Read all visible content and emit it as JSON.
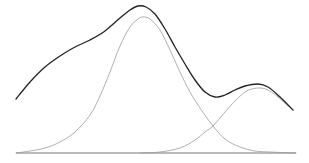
{
  "chart_data": {
    "type": "line",
    "title": "",
    "xlabel": "",
    "ylabel": "",
    "grid": false,
    "legend": "none",
    "baseline": {
      "x1": 16,
      "x2": 296,
      "y": 153,
      "color": "#777777"
    },
    "series": [
      {
        "name": "mixture",
        "color": "#222222",
        "width": 1.3,
        "points": [
          [
            16,
            99
          ],
          [
            30,
            82
          ],
          [
            45,
            67
          ],
          [
            60,
            56
          ],
          [
            75,
            47
          ],
          [
            90,
            40
          ],
          [
            105,
            31
          ],
          [
            120,
            18
          ],
          [
            130,
            10
          ],
          [
            138,
            6
          ],
          [
            146,
            7
          ],
          [
            155,
            14
          ],
          [
            165,
            29
          ],
          [
            175,
            47
          ],
          [
            185,
            64
          ],
          [
            195,
            80
          ],
          [
            205,
            92
          ],
          [
            215,
            97
          ],
          [
            225,
            95
          ],
          [
            235,
            90
          ],
          [
            245,
            86
          ],
          [
            258,
            84
          ],
          [
            268,
            87
          ],
          [
            280,
            97
          ],
          [
            293,
            110
          ]
        ]
      },
      {
        "name": "component-1",
        "color": "#9a9a9a",
        "width": 0.8,
        "points": [
          [
            16,
            153
          ],
          [
            30,
            151
          ],
          [
            45,
            148
          ],
          [
            60,
            142
          ],
          [
            75,
            132
          ],
          [
            90,
            115
          ],
          [
            100,
            96
          ],
          [
            110,
            72
          ],
          [
            120,
            46
          ],
          [
            130,
            27
          ],
          [
            138,
            19
          ],
          [
            143,
            17
          ],
          [
            150,
            19
          ],
          [
            160,
            30
          ],
          [
            170,
            50
          ],
          [
            180,
            72
          ],
          [
            190,
            92
          ],
          [
            200,
            108
          ],
          [
            213,
            126
          ],
          [
            225,
            139
          ],
          [
            240,
            147
          ],
          [
            255,
            151
          ],
          [
            270,
            152
          ],
          [
            296,
            153
          ]
        ]
      },
      {
        "name": "component-2",
        "color": "#9a9a9a",
        "width": 0.8,
        "points": [
          [
            140,
            153
          ],
          [
            160,
            152
          ],
          [
            180,
            148
          ],
          [
            195,
            140
          ],
          [
            205,
            132
          ],
          [
            213,
            126
          ],
          [
            225,
            112
          ],
          [
            235,
            101
          ],
          [
            245,
            92
          ],
          [
            252,
            89
          ],
          [
            260,
            88
          ],
          [
            268,
            90
          ],
          [
            278,
            97
          ],
          [
            288,
            106
          ],
          [
            293,
            110
          ]
        ]
      }
    ]
  }
}
